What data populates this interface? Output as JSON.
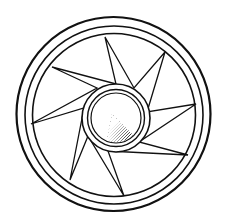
{
  "image": {
    "title": "Wheel line drawing",
    "description": "Black-and-white line illustration of a wheel: triple outer rim, eight-pointed star spokes, double-ring hub with stippled shading",
    "width": 230,
    "height": 224,
    "background": "#ffffff",
    "stroke_color": "#111111"
  },
  "wheel": {
    "center": [
      113,
      113
    ],
    "rims": [
      {
        "name": "outer-rim",
        "cx": 113.5,
        "cy": 114,
        "r": 97,
        "stroke_width": 2.2
      },
      {
        "name": "middle-rim",
        "cx": 114,
        "cy": 115,
        "r": 89,
        "stroke_width": 1.6
      },
      {
        "name": "inner-rim",
        "cx": 114,
        "cy": 115,
        "r": 81.5,
        "stroke_width": 1.6
      }
    ],
    "star": {
      "points": 8,
      "tips": [
        [
          105,
          37
        ],
        [
          165,
          52
        ],
        [
          196,
          104
        ],
        [
          188,
          155
        ],
        [
          124,
          196
        ],
        [
          70,
          180
        ],
        [
          31,
          124
        ],
        [
          52,
          67
        ]
      ],
      "valleys": [
        [
          134,
          88
        ],
        [
          147,
          112
        ],
        [
          139,
          142
        ],
        [
          108,
          151
        ],
        [
          88,
          136
        ],
        [
          84,
          108
        ],
        [
          97,
          88
        ],
        [
          116,
          84
        ]
      ]
    },
    "hub": {
      "cx": 116,
      "cy": 118,
      "rings": [
        {
          "name": "hub-outer-ring",
          "r": 34,
          "stroke_width": 1.6
        },
        {
          "name": "hub-middle-ring",
          "r": 28.5,
          "stroke_width": 1.4
        },
        {
          "name": "hub-inner-ring",
          "r": 25,
          "stroke_width": 1.2
        }
      ],
      "shading": {
        "quadrant": "lower-right",
        "style": "stipple"
      }
    }
  }
}
